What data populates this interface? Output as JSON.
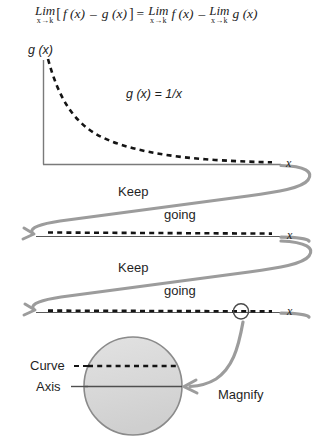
{
  "figure": {
    "equation": {
      "lim_word": "Lim",
      "lim_sub": "x→k",
      "open_bracket": "[",
      "term1": "f (x)",
      "minus": "–",
      "term2": "g (x)",
      "close_bracket": "]",
      "equals": "=",
      "rhs_term1": "f (x)",
      "rhs_minus": "–",
      "rhs_term2": "g (x)"
    },
    "graph": {
      "y_axis_label": "g (x)",
      "x_axis_label": "x",
      "curve_equation": "g (x) = 1/x"
    },
    "flow": {
      "keep_1": "Keep",
      "going_1": "going",
      "keep_2": "Keep",
      "going_2": "going",
      "axis_label_2": "x",
      "axis_label_3": "x"
    },
    "inset": {
      "curve_label": "Curve",
      "axis_label": "Axis",
      "magnify_label": "Magnify"
    },
    "caption": "",
    "colors": {
      "ink": "#1f1f1f",
      "gray_path": "#9a9a9a",
      "axis": "#6e6e6e",
      "inset_fill": "#d9d9d9",
      "inset_stroke": "#8a8a8a"
    }
  }
}
